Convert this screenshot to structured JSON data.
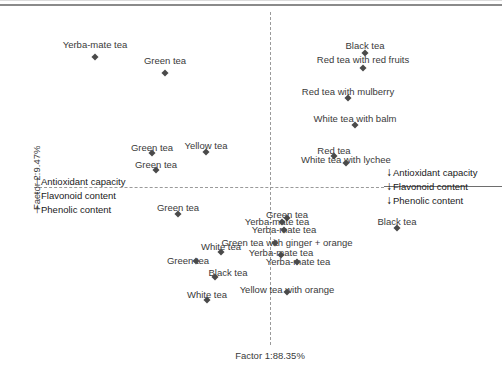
{
  "chart_data": {
    "type": "scatter",
    "title": "",
    "xlabel": "Factor 1:88.35%",
    "ylabel": "Factor 2:9.47%",
    "grid": false,
    "legend_position": "inside-left-and-right",
    "axis_origin_lines": {
      "vertical_dashed_at_x": 0,
      "horizontal_dashed_at_y": 0
    },
    "points": [
      {
        "label": "Yerba-mate tea",
        "px": 95,
        "py": 57,
        "lx": 95,
        "ly": 40
      },
      {
        "label": "Green tea",
        "px": 165,
        "py": 73,
        "lx": 165,
        "ly": 56
      },
      {
        "label": "Black tea",
        "px": 365,
        "py": 53,
        "lx": 365,
        "ly": 41
      },
      {
        "label": "Red tea with red fruits",
        "px": 363,
        "py": 68,
        "lx": 363,
        "ly": 55
      },
      {
        "label": "Red tea with mulberry",
        "px": 348,
        "py": 98,
        "lx": 348,
        "ly": 87
      },
      {
        "label": "White tea with balm",
        "px": 355,
        "py": 125,
        "lx": 355,
        "ly": 114
      },
      {
        "label": "Red tea",
        "px": 334,
        "py": 156,
        "lx": 334,
        "ly": 146
      },
      {
        "label": "White tea with lychee",
        "px": 346,
        "py": 163,
        "lx": 346,
        "ly": 155
      },
      {
        "label": "Green tea",
        "px": 152,
        "py": 153,
        "lx": 152,
        "ly": 143
      },
      {
        "label": "Green tea",
        "px": 156,
        "py": 170,
        "lx": 156,
        "ly": 160
      },
      {
        "label": "Yellow tea",
        "px": 206,
        "py": 152,
        "lx": 206,
        "ly": 141
      },
      {
        "label": "Green tea",
        "px": 178,
        "py": 214,
        "lx": 178,
        "ly": 203
      },
      {
        "label": "Green tea",
        "px": 287,
        "py": 218,
        "lx": 287,
        "ly": 210
      },
      {
        "label": "Yerba-mate tea",
        "px": 282,
        "py": 222,
        "lx": 277,
        "ly": 217
      },
      {
        "label": "Yerba-mate tea",
        "px": 284,
        "py": 230,
        "lx": 284,
        "ly": 225
      },
      {
        "label": "Green tea with ginger + orange",
        "px": 275,
        "py": 243,
        "lx": 287,
        "ly": 238
      },
      {
        "label": "Yerba-mate tea",
        "px": 281,
        "py": 255,
        "lx": 281,
        "ly": 248
      },
      {
        "label": "Yerba-mate tea",
        "px": 297,
        "py": 262,
        "lx": 298,
        "ly": 257
      },
      {
        "label": "White tea",
        "px": 221,
        "py": 252,
        "lx": 221,
        "ly": 242
      },
      {
        "label": "Green tea",
        "px": 196,
        "py": 261,
        "lx": 188,
        "ly": 256
      },
      {
        "label": "Black tea",
        "px": 215,
        "py": 277,
        "lx": 228,
        "ly": 268
      },
      {
        "label": "White tea",
        "px": 207,
        "py": 300,
        "lx": 207,
        "ly": 290
      },
      {
        "label": "Yellow tea with orange",
        "px": 287,
        "py": 292,
        "lx": 287,
        "ly": 285
      },
      {
        "label": "Black tea",
        "px": 397,
        "py": 228,
        "lx": 397,
        "ly": 217
      }
    ],
    "annotations": {
      "left_group": {
        "arrow": "up-arrow-icon",
        "arrow_glyph": "↑",
        "items": [
          "Antioxidant capacity",
          "Flavonoid content",
          "Phenolic content"
        ]
      },
      "right_group": {
        "arrow": "down-arrow-icon",
        "arrow_glyph": "↓",
        "items": [
          "Antioxidant capacity",
          "Flavonoid content",
          "Phenolic content"
        ]
      }
    },
    "colors": {
      "marker": "#4a4a4a",
      "axis_line": "#9a9a9a",
      "text": "#3a3a3a",
      "annotation_text": "#1a1a1a",
      "background": "#ffffff"
    }
  }
}
